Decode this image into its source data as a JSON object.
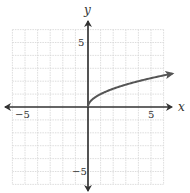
{
  "chart_data": {
    "type": "line",
    "title": "",
    "function": "y = sqrt(x)",
    "xlabel": "x",
    "ylabel": "y",
    "xlim": [
      -6,
      6
    ],
    "ylim": [
      -6,
      6
    ],
    "grid": true,
    "grid_step": 1,
    "tick_labels": {
      "x": [
        {
          "value": -5,
          "label": "−5"
        },
        {
          "value": 5,
          "label": "5"
        }
      ],
      "y": [
        {
          "value": 5,
          "label": "5"
        },
        {
          "value": -5,
          "label": "−5"
        }
      ]
    },
    "series": [
      {
        "name": "sqrt(x)",
        "x": [
          0,
          0.25,
          1,
          2,
          3,
          4,
          5,
          6,
          6.7
        ],
        "values": [
          0,
          0.5,
          1,
          1.41,
          1.73,
          2,
          2.24,
          2.45,
          2.59
        ],
        "end_arrow": true,
        "color": "#555555"
      }
    ],
    "axes_arrows": true
  },
  "labels": {
    "x_axis": "x",
    "y_axis": "y",
    "x_neg5": "−5",
    "x_pos5": "5",
    "y_pos5": "5",
    "y_neg5": "−5"
  },
  "colors": {
    "grid": "#d4d4d4",
    "axis": "#333333",
    "curve": "#555555"
  }
}
